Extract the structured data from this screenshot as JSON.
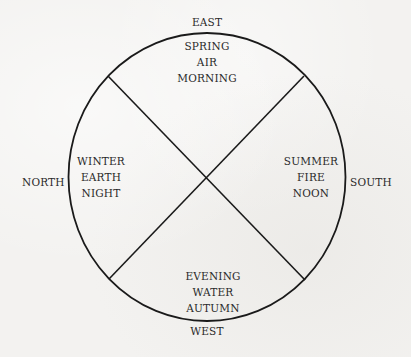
{
  "diagram": {
    "title": "",
    "directions": {
      "top": "EAST",
      "left": "NORTH",
      "right": "SOUTH",
      "bottom": "WEST"
    },
    "quadrants": {
      "top": [
        "SPRING",
        "AIR",
        "MORNING"
      ],
      "left": [
        "WINTER",
        "EARTH",
        "NIGHT"
      ],
      "right": [
        "SUMMER",
        "FIRE",
        "NOON"
      ],
      "bottom": [
        "EVENING",
        "WATER",
        "AUTUMN"
      ]
    },
    "colors": {
      "background": "#f3f2f0",
      "stroke": "#1a1a1a",
      "text": "#2a2a2a"
    }
  }
}
